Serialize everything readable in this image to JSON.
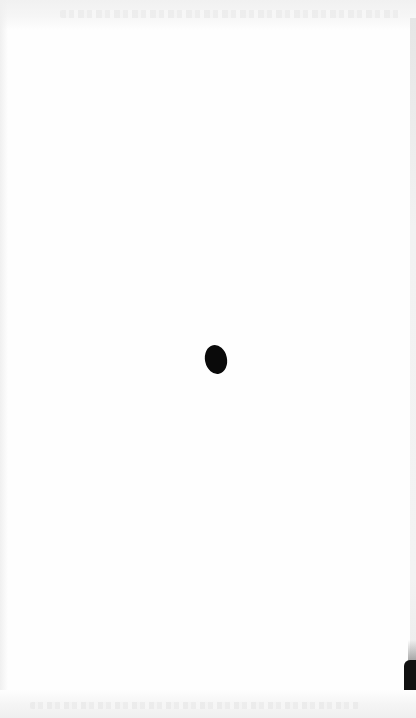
{
  "page": {
    "type": "blank-scanned-page",
    "background_color": "#fefefe",
    "header_text_legible": false,
    "footer_text_legible": false
  },
  "marks": {
    "center_dot": {
      "shape": "ellipse",
      "color": "#0a0a0a",
      "x": 205,
      "y": 345,
      "width": 22,
      "height": 29
    },
    "edge_mark": {
      "color": "#111111",
      "x": 404,
      "y": 660,
      "width": 12,
      "height": 58
    }
  }
}
